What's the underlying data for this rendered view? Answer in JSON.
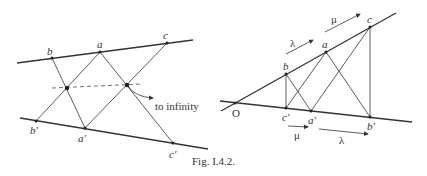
{
  "caption": "Fig. I.4.2.",
  "left_diagram": {
    "labels": {
      "b": "b",
      "a": "a",
      "c": "c",
      "b_prime": "b′",
      "a_prime": "a′",
      "c_prime": "c′"
    },
    "annotation": "to infinity"
  },
  "right_diagram": {
    "labels": {
      "O": "O",
      "b": "b",
      "a": "a",
      "c": "c",
      "c_prime": "c′",
      "a_prime": "a′",
      "b_prime": "b′"
    },
    "arrows": {
      "top_lambda": "λ",
      "top_mu": "μ",
      "bottom_mu": "μ",
      "bottom_lambda": "λ"
    }
  }
}
